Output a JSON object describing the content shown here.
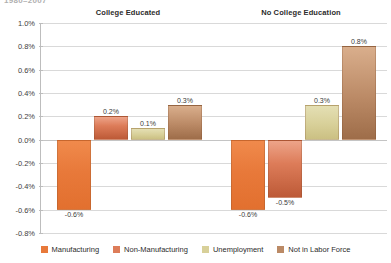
{
  "top_title": "1980–2007",
  "chart_data": {
    "type": "bar",
    "title": "",
    "xlabel": "",
    "ylabel": "",
    "ylim": [
      -0.8,
      1.0
    ],
    "ytick_step": 0.2,
    "grid": true,
    "legend_position": "bottom",
    "value_format": "percent",
    "categories": [
      "College Educated",
      "No College Education"
    ],
    "series": [
      {
        "name": "Manufacturing",
        "color": "#e8793a",
        "values": [
          -0.6,
          -0.6
        ],
        "labels": [
          "-0.6%",
          "-0.6%"
        ]
      },
      {
        "name": "Non-Manufacturing",
        "color": "#dd7c59",
        "values": [
          0.2,
          -0.5
        ],
        "labels": [
          "0.2%",
          "-0.5%"
        ]
      },
      {
        "name": "Unemployment",
        "color": "#d8d099",
        "values": [
          0.1,
          0.3
        ],
        "labels": [
          "0.1%",
          "0.3%"
        ]
      },
      {
        "name": "Not in Labor Force",
        "color": "#bb8a66",
        "values": [
          0.3,
          0.8
        ],
        "labels": [
          "0.3%",
          "0.8%"
        ]
      }
    ],
    "ytick_labels": [
      "1.0%",
      "0.8%",
      "0.6%",
      "0.4%",
      "0.2%",
      "0.0%",
      "-0.2%",
      "-0.4%",
      "-0.6%",
      "-0.8%"
    ],
    "ytick_values": [
      1.0,
      0.8,
      0.6,
      0.4,
      0.2,
      0.0,
      -0.2,
      -0.4,
      -0.6,
      -0.8
    ]
  }
}
